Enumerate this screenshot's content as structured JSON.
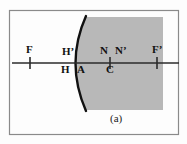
{
  "figure": {
    "caption": "(a)",
    "description_title": "Refraction at a single spherical surface — cardinal points",
    "colors": {
      "medium_fill": "#b8b8b8",
      "surface_stroke": "#111111",
      "axis_stroke": "#2b2b2b",
      "frame_stroke": "#8a8a8a",
      "background": "#fdfdfd",
      "label_color": "#111111"
    },
    "frame": {
      "x": 9,
      "y": 10,
      "width": 169,
      "height": 124
    },
    "medium_region": {
      "label": "denser-medium-shaded-region",
      "left_edge_x": 76,
      "right_edge_x": 163,
      "top_y": 17,
      "bottom_y": 110
    },
    "optical_axis": {
      "label": "optical-axis",
      "y": 63,
      "x_start": 12,
      "x_end": 179
    },
    "refracting_surface": {
      "label": "spherical-refracting-surface",
      "vertex_x": 76,
      "top_x": 86,
      "top_y": 16,
      "bottom_x": 86,
      "bottom_y": 111
    },
    "points": [
      {
        "id": "F",
        "label": "F",
        "name": "front-focal-point-F",
        "x": 30,
        "label_x": 26,
        "label_y": 44,
        "label_side": "above",
        "tick": true,
        "tick_half_height": 6
      },
      {
        "id": "Hprime",
        "label": "H’",
        "name": "principal-point-H-prime",
        "x": 73,
        "label_x": 62,
        "label_y": 46,
        "label_side": "above",
        "tick": false,
        "tick_half_height": 0
      },
      {
        "id": "H",
        "label": "H",
        "name": "principal-point-H",
        "x": 68,
        "label_x": 61,
        "label_y": 64,
        "label_side": "below",
        "tick": false,
        "tick_half_height": 0
      },
      {
        "id": "A",
        "label": "A",
        "name": "surface-vertex-A",
        "x": 79,
        "label_x": 77,
        "label_y": 64,
        "label_side": "below",
        "tick": false,
        "tick_half_height": 0
      },
      {
        "id": "N",
        "label": "N",
        "name": "nodal-point-N",
        "x": 104,
        "label_x": 100,
        "label_y": 45,
        "label_side": "above",
        "tick": false,
        "tick_half_height": 0
      },
      {
        "id": "Nprime",
        "label": "N’",
        "name": "nodal-point-N-prime",
        "x": 120,
        "label_x": 115,
        "label_y": 45,
        "label_side": "above",
        "tick": false,
        "tick_half_height": 0
      },
      {
        "id": "C",
        "label": "C",
        "name": "center-of-curvature-C",
        "x": 110,
        "label_x": 106,
        "label_y": 64,
        "label_side": "below",
        "tick": true,
        "tick_half_height": 6
      },
      {
        "id": "Fprime",
        "label": "F’",
        "name": "back-focal-point-F-prime",
        "x": 157,
        "label_x": 152,
        "label_y": 44,
        "label_side": "above",
        "tick": true,
        "tick_half_height": 6
      }
    ],
    "caption_position": {
      "x": 110,
      "y": 113
    }
  }
}
